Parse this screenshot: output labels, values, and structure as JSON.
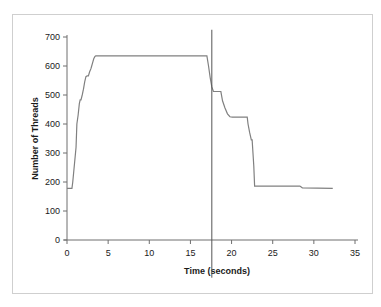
{
  "figure": {
    "caption_remnant": "",
    "frame_color": "#cfcfcf",
    "background": "#ffffff"
  },
  "chart_data": {
    "type": "line",
    "title": "",
    "subtitle": "",
    "xlabel": "Time (seconds)",
    "ylabel": "Number of Threads",
    "xlim": [
      0,
      35
    ],
    "ylim": [
      0,
      700
    ],
    "xticks": [
      0,
      5,
      10,
      15,
      20,
      25,
      30,
      35
    ],
    "yticks": [
      0,
      100,
      200,
      300,
      400,
      500,
      600,
      700
    ],
    "xtick_labels": [
      "0",
      "5",
      "10",
      "15",
      "20",
      "25",
      "30",
      "35"
    ],
    "ytick_labels": [
      "0",
      "100",
      "200",
      "300",
      "400",
      "500",
      "600",
      "700"
    ],
    "grid": false,
    "legend": null,
    "legend_position": "none",
    "line_color": "#808080",
    "line_width": 1.2,
    "series": [
      {
        "name": "Number of Threads",
        "x": [
          0.0,
          0.6,
          0.7,
          1.1,
          1.2,
          1.35,
          1.5,
          1.6,
          1.7,
          1.85,
          2.0,
          2.15,
          2.3,
          2.45,
          2.6,
          2.75,
          2.9,
          3.0,
          3.1,
          3.25,
          3.4,
          3.5,
          17.0,
          17.2,
          17.4,
          17.6,
          17.8,
          18.7,
          18.9,
          19.2,
          19.5,
          19.8,
          20.1,
          21.9,
          22.0,
          22.2,
          22.4,
          22.5,
          22.6,
          22.7,
          22.8,
          28.3,
          28.6,
          32.3
        ],
        "y": [
          178,
          178,
          200,
          320,
          400,
          430,
          470,
          483,
          483,
          500,
          520,
          545,
          563,
          566,
          566,
          580,
          590,
          600,
          610,
          625,
          633,
          635,
          635,
          600,
          560,
          528,
          512,
          512,
          480,
          455,
          435,
          425,
          424,
          424,
          400,
          370,
          345,
          345,
          300,
          255,
          186,
          186,
          180,
          178
        ]
      }
    ],
    "annotations": [
      {
        "name": "vertical-marker",
        "type": "vline",
        "x": 17.6,
        "y_top": 725,
        "y_bottom": -130,
        "color": "#555555",
        "width": 1.0,
        "label": ""
      }
    ]
  }
}
